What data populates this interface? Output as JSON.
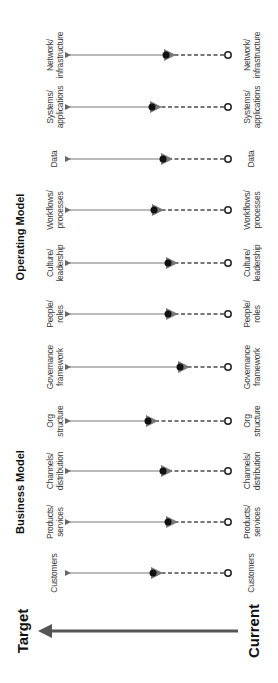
{
  "chart_data": {
    "type": "diagram",
    "title": "",
    "orientation": "rotated 90° counter-clockwise; target at left, current at right",
    "axis": {
      "start_label": "Current",
      "end_label": "Target"
    },
    "groups": [
      {
        "name": "Business Model",
        "items": [
          "Customers",
          "Products/ services",
          "Channels/ distribution"
        ]
      },
      {
        "name": "Operating Model",
        "items": [
          "Org structure",
          "Governance framework",
          "People/ roles",
          "Culture/ leadership",
          "Workflows/ processes",
          "Data",
          "Systems/ applications",
          "Network/ infrastructure"
        ]
      }
    ],
    "rows": [
      {
        "label": "Customers",
        "progress": 0.44
      },
      {
        "label": "Products/ services",
        "progress": 0.36
      },
      {
        "label": "Channels/ distribution",
        "progress": 0.39
      },
      {
        "label": "Org structure",
        "progress": 0.48
      },
      {
        "label": "Governance framework",
        "progress": 0.26
      },
      {
        "label": "People/ roles",
        "progress": 0.36
      },
      {
        "label": "Culture/ leadership",
        "progress": 0.36
      },
      {
        "label": "Workflows/ processes",
        "progress": 0.43
      },
      {
        "label": "Data",
        "progress": 0.38
      },
      {
        "label": "Systems/ applications",
        "progress": 0.44
      },
      {
        "label": "Network/ infrastructure",
        "progress": 0.36
      }
    ]
  },
  "legend": {
    "target": "Target",
    "current": "Current"
  },
  "headers": {
    "business": "Business Model",
    "operating": "Operating Model"
  },
  "labels": {
    "network": [
      "Network/",
      "infrastructure"
    ],
    "systems": [
      "Systems/",
      "applications"
    ],
    "data": [
      "Data"
    ],
    "workflows": [
      "Workflows/",
      "processes"
    ],
    "culture": [
      "Culture/",
      "leadership"
    ],
    "people": [
      "People/",
      "roles"
    ],
    "governance": [
      "Governance",
      "framework"
    ],
    "org": [
      "Org",
      "structure"
    ],
    "channels": [
      "Channels/",
      "distribution"
    ],
    "products": [
      "Products/",
      "services"
    ],
    "customers": [
      "Customers"
    ]
  }
}
